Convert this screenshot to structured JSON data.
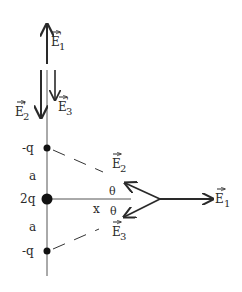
{
  "diagram": {
    "type": "electric-field-superposition",
    "charges": [
      {
        "id": "top",
        "label": "-q",
        "x": 47,
        "y": 148
      },
      {
        "id": "middle",
        "label": "2q",
        "x": 47,
        "y": 199
      },
      {
        "id": "bottom",
        "label": "-q",
        "x": 47,
        "y": 251
      }
    ],
    "spacing_labels": [
      {
        "label": "a",
        "x": 30,
        "y": 178
      },
      {
        "label": "a",
        "x": 30,
        "y": 228
      }
    ],
    "distance_label": {
      "label": "x",
      "x": 97,
      "y": 212
    },
    "angles": [
      {
        "label": "θ",
        "x": 110,
        "y": 193
      },
      {
        "label": "θ",
        "x": 111,
        "y": 214
      }
    ],
    "field_point_vectors": [
      {
        "label": "E",
        "subscript": "1",
        "x": 216,
        "y": 202
      },
      {
        "label": "E",
        "subscript": "2",
        "x": 114,
        "y": 162
      },
      {
        "label": "E",
        "subscript": "3",
        "x": 114,
        "y": 234
      }
    ],
    "axis_point_vectors": [
      {
        "label": "E",
        "subscript": "1",
        "prime": "'",
        "x": 54,
        "y": 42
      },
      {
        "label": "E",
        "subscript": "2",
        "prime": "'",
        "x": 17,
        "y": 112
      },
      {
        "label": "E",
        "subscript": "3",
        "prime": "'",
        "x": 58,
        "y": 109
      }
    ],
    "colors": {
      "ink": "#2a2a2a",
      "paper": "#ffffff"
    }
  }
}
